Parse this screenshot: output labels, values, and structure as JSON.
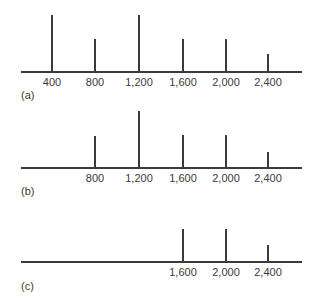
{
  "chart_data": [
    {
      "type": "bar",
      "title": "",
      "panel_label": "(a)",
      "xlabel": "",
      "ylabel": "",
      "categories": [
        "400",
        "800",
        "1,200",
        "1,600",
        "2,000",
        "2,400"
      ],
      "x": [
        400,
        800,
        1200,
        1600,
        2000,
        2400
      ],
      "values": [
        56,
        32,
        56,
        32,
        32,
        17
      ],
      "value_units": "relative line height (px)",
      "grid": false,
      "axis_range_x": [
        200,
        2700
      ]
    },
    {
      "type": "bar",
      "title": "",
      "panel_label": "(b)",
      "xlabel": "",
      "ylabel": "",
      "categories": [
        "800",
        "1,200",
        "1,600",
        "2,000",
        "2,400"
      ],
      "x": [
        800,
        1200,
        1600,
        2000,
        2400
      ],
      "values": [
        31,
        56,
        32,
        32,
        15
      ],
      "value_units": "relative line height (px)",
      "grid": false,
      "axis_range_x": [
        200,
        2700
      ]
    },
    {
      "type": "bar",
      "title": "",
      "panel_label": "(c)",
      "xlabel": "",
      "ylabel": "",
      "categories": [
        "1,600",
        "2,000",
        "2,400"
      ],
      "x": [
        1600,
        2000,
        2400
      ],
      "values": [
        32,
        32,
        16
      ],
      "value_units": "relative line height (px)",
      "grid": false,
      "axis_range_x": [
        200,
        2700
      ]
    }
  ],
  "layout": {
    "x_px": {
      "400": 52,
      "800": 95,
      "1200": 139,
      "1600": 183,
      "2000": 226,
      "2400": 268
    },
    "axis_y": [
      71,
      167,
      261
    ],
    "label_y": [
      76,
      172,
      266
    ],
    "panel_label_y": [
      89,
      185,
      280
    ]
  }
}
